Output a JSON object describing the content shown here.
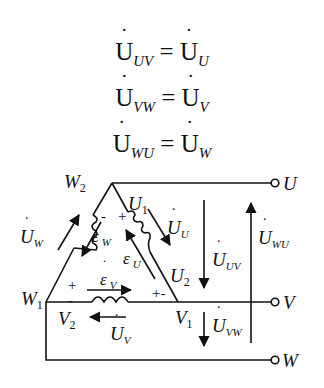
{
  "equations": [
    {
      "lhs_sym": "U",
      "lhs_sub": "UV",
      "eq": "=",
      "rhs_sym": "U",
      "rhs_sub": "U"
    },
    {
      "lhs_sym": "U",
      "lhs_sub": "VW",
      "eq": "=",
      "rhs_sym": "U",
      "rhs_sub": "V"
    },
    {
      "lhs_sym": "U",
      "lhs_sub": "WU",
      "eq": "=",
      "rhs_sym": "U",
      "rhs_sub": "W"
    }
  ],
  "diagram": {
    "node_labels": {
      "W2": {
        "main": "W",
        "sub": "2"
      },
      "W1": {
        "main": "W",
        "sub": "1"
      },
      "U1": {
        "main": "U",
        "sub": "1"
      },
      "U2": {
        "main": "U",
        "sub": "2"
      },
      "V1": {
        "main": "V",
        "sub": "1"
      },
      "V2": {
        "main": "V",
        "sub": "2"
      }
    },
    "terminals": {
      "U": "U",
      "V": "V",
      "W": "W"
    },
    "phase_voltages": {
      "UW": {
        "sym": "U",
        "sub": "W"
      },
      "UU": {
        "sym": "U",
        "sub": "U"
      },
      "UV": {
        "sym": "U",
        "sub": "V"
      }
    },
    "emfs": {
      "eW": {
        "sym": "ε",
        "sub": "W"
      },
      "eU": {
        "sym": "ε",
        "sub": "U"
      },
      "eV": {
        "sym": "ε",
        "sub": "V"
      }
    },
    "line_voltages": {
      "UUV": {
        "sym": "U",
        "sub": "UV"
      },
      "UVW": {
        "sym": "U",
        "sub": "VW"
      },
      "UWU": {
        "sym": "U",
        "sub": "WU"
      }
    },
    "polarity": {
      "w_minus": "-",
      "u_plus": "+",
      "v_plus": "+",
      "v_minus": "-",
      "uv_junction": "+-"
    }
  }
}
